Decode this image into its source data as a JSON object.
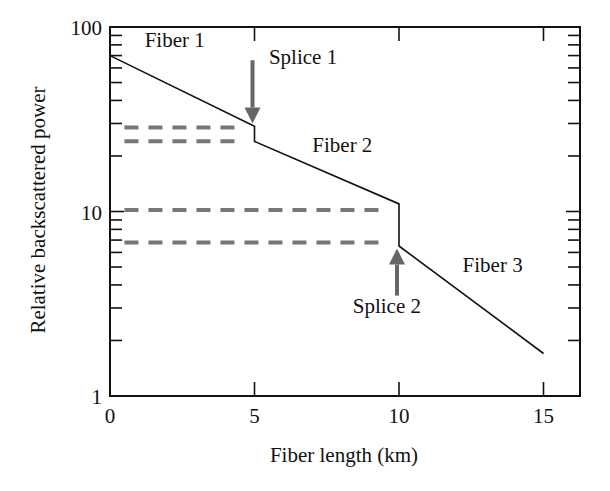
{
  "chart_data": {
    "type": "line",
    "title": "",
    "xlabel": "Fiber length (km)",
    "ylabel": "Relative backscattered power",
    "xlim": [
      0,
      16.3
    ],
    "ylim": [
      1,
      100
    ],
    "yscale": "log",
    "grid": false,
    "legend": null,
    "x_ticks": [
      0,
      5,
      10,
      15
    ],
    "x_tick_labels": [
      "0",
      "5",
      "10",
      "15"
    ],
    "y_ticks": [
      1,
      10,
      100
    ],
    "y_tick_labels": [
      "1",
      "10",
      "100"
    ],
    "series": [
      {
        "name": "Backscatter trace",
        "style": "solid",
        "color": "#111111",
        "points": [
          [
            0,
            70
          ],
          [
            5,
            29
          ],
          [
            5,
            24
          ],
          [
            10,
            11
          ],
          [
            10,
            6.5
          ],
          [
            15,
            1.7
          ]
        ]
      }
    ],
    "reference_lines": [
      {
        "style": "dashed",
        "color": "#777777",
        "x": [
          0.5,
          4.6
        ],
        "y": 28.5
      },
      {
        "style": "dashed",
        "color": "#777777",
        "x": [
          0.5,
          4.6
        ],
        "y": 24
      },
      {
        "style": "dashed",
        "color": "#777777",
        "x": [
          0.5,
          9.5
        ],
        "y": 10.2
      },
      {
        "style": "dashed",
        "color": "#777777",
        "x": [
          0.5,
          9.5
        ],
        "y": 6.8
      }
    ],
    "annotations": [
      {
        "text": "Fiber 1",
        "x": 1.2,
        "y": 78
      },
      {
        "text": "Splice 1",
        "x": 5.5,
        "y": 63
      },
      {
        "text": "Fiber 2",
        "x": 7.0,
        "y": 21
      },
      {
        "text": "Fiber 3",
        "x": 12.2,
        "y": 4.7
      },
      {
        "text": "Splice 2",
        "x": 8.4,
        "y": 2.8
      }
    ],
    "arrows": [
      {
        "label": "Splice 1",
        "direction": "down",
        "x": 5,
        "from_y": 66,
        "to_y": 30,
        "color": "#666666"
      },
      {
        "label": "Splice 2",
        "direction": "up",
        "x": 10,
        "from_y": 3.5,
        "to_y": 6.3,
        "color": "#666666"
      }
    ]
  }
}
